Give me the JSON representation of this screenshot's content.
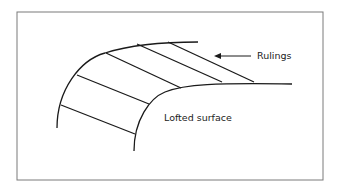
{
  "diagram": {
    "labels": {
      "rulings": "Rulings",
      "surface": "Lofted surface"
    },
    "colors": {
      "stroke": "#1a1a1a",
      "frame": "#7a7a7a",
      "background": "#ffffff"
    },
    "ruling_count": 5
  }
}
